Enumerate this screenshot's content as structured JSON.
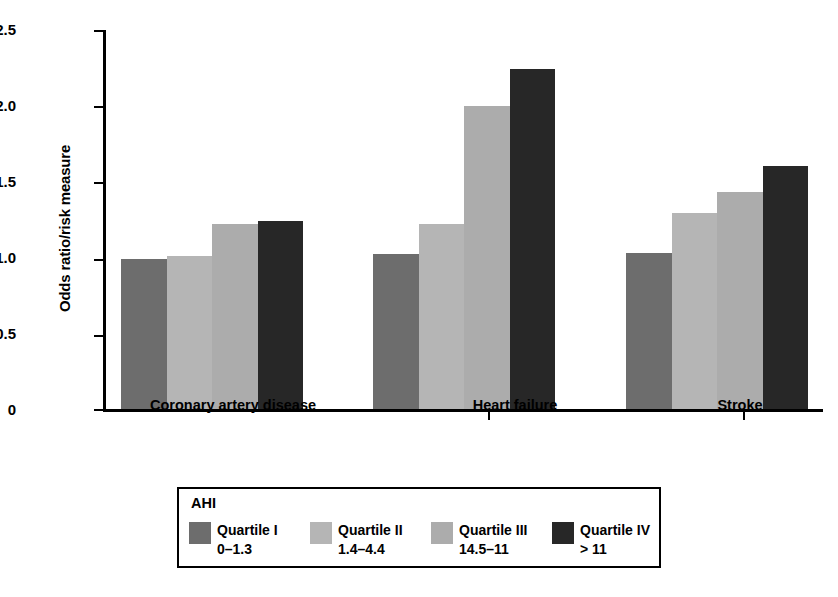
{
  "chart_data": {
    "type": "bar",
    "title": "",
    "xlabel": "",
    "ylabel": "Odds ratio/risk measure",
    "ylim": [
      0,
      2.5
    ],
    "yticks": [
      "0",
      "0.5",
      "1.0",
      "1.5",
      "2.0",
      "2.5"
    ],
    "ytick_values": [
      0,
      0.5,
      1.0,
      1.5,
      2.0,
      2.5
    ],
    "grid": false,
    "legend_position": "bottom",
    "legend_title": "AHI",
    "categories": [
      "Coronary artery disease",
      "Heart failure",
      "Stroke"
    ],
    "series": [
      {
        "name": "Quartile I",
        "range": "0–1.3",
        "color": "#6d6d6d",
        "values": [
          0.99,
          1.02,
          1.03
        ]
      },
      {
        "name": "Quartile II",
        "range": "1.4–4.4",
        "color": "#b5b5b5",
        "values": [
          1.01,
          1.22,
          1.29
        ]
      },
      {
        "name": "Quartile III",
        "range": "14.5–11",
        "color": "#acacac",
        "values": [
          1.22,
          2.0,
          1.43
        ]
      },
      {
        "name": "Quartile IV",
        "range": "> 11",
        "color": "#272727",
        "values": [
          1.24,
          2.24,
          1.6
        ]
      }
    ]
  },
  "legend": {
    "title": "AHI",
    "items": [
      {
        "label": "Quartile I",
        "range": "0–1.3"
      },
      {
        "label": "Quartile II",
        "range": "1.4–4.4"
      },
      {
        "label": "Quartile III",
        "range": "14.5–11"
      },
      {
        "label": "Quartile IV",
        "range": "> 11"
      }
    ]
  },
  "axis": {
    "y_title": "Odds ratio/risk measure",
    "y_tick_labels": [
      "2.5",
      "2.0",
      "1.5",
      "1.0",
      "0.5",
      "0"
    ],
    "x_tick_labels": [
      "Coronary artery disease",
      "Heart failure",
      "Stroke"
    ]
  }
}
